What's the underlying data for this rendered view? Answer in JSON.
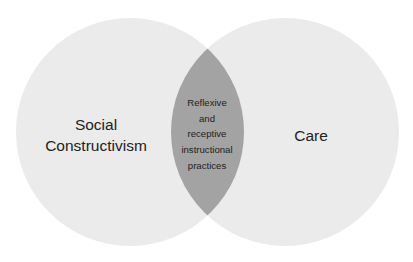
{
  "diagram": {
    "type": "venn",
    "colors": {
      "circle_fill": "#ebebeb",
      "overlap_fill": "#a3a3a3",
      "text": "#222222",
      "background": "#ffffff"
    },
    "left_circle": {
      "lines": [
        "Social",
        "Constructivism"
      ]
    },
    "right_circle": {
      "lines": [
        "Care"
      ]
    },
    "overlap": {
      "lines": [
        "Reflexive",
        "and",
        "receptive",
        "instructional",
        "practices"
      ]
    }
  }
}
